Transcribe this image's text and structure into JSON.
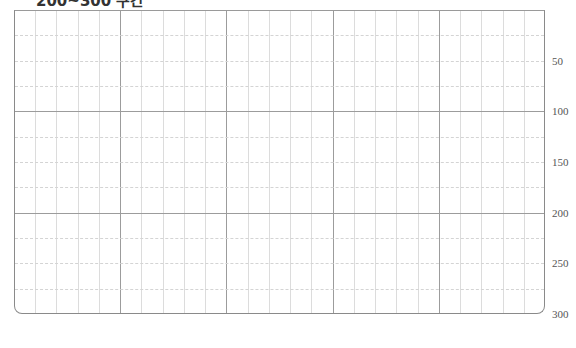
{
  "title": "200~300 구간",
  "grid": {
    "columns_major": 5,
    "columns_minor_per_major": 5,
    "rows_major": 3,
    "rows_minor_per_major": 4
  },
  "y_axis": {
    "min": 0,
    "max": 300,
    "labels": [
      "50",
      "100",
      "150",
      "200",
      "250",
      "300"
    ],
    "label_values": [
      50,
      100,
      150,
      200,
      250,
      300
    ]
  },
  "colors": {
    "major_line": "#9c9c9c",
    "minor_line": "#dcdcdc",
    "frame": "#8a8a8a",
    "label": "#555555"
  }
}
